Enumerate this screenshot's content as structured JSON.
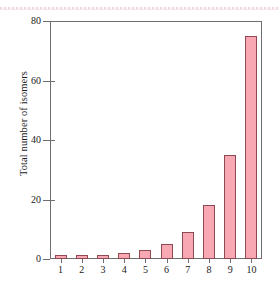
{
  "figure": {
    "background_color": "#ffffff",
    "frame_color": "#6e6e6e",
    "artifact": "pink-scan-line"
  },
  "axes": {
    "y_label": "Total number of isomers",
    "y_ticks": [
      "0",
      "20",
      "40",
      "60",
      "80"
    ],
    "x_ticks": [
      "1",
      "2",
      "3",
      "4",
      "5",
      "6",
      "7",
      "8",
      "9",
      "10"
    ]
  },
  "chart_data": {
    "type": "bar",
    "title": "",
    "xlabel": "",
    "ylabel": "Total number of isomers",
    "categories": [
      "1",
      "2",
      "3",
      "4",
      "5",
      "6",
      "7",
      "8",
      "9",
      "10"
    ],
    "values": [
      1,
      1,
      1,
      2,
      3,
      5,
      9,
      18,
      35,
      75
    ],
    "ylim": [
      0,
      80
    ],
    "xlim": [
      0.5,
      10.5
    ],
    "ytick_values": [
      0,
      20,
      40,
      60,
      80
    ],
    "grid": false,
    "legend": null,
    "bar_fill_color": "#f7a8b2",
    "bar_edge_color": "#8d4a52"
  }
}
